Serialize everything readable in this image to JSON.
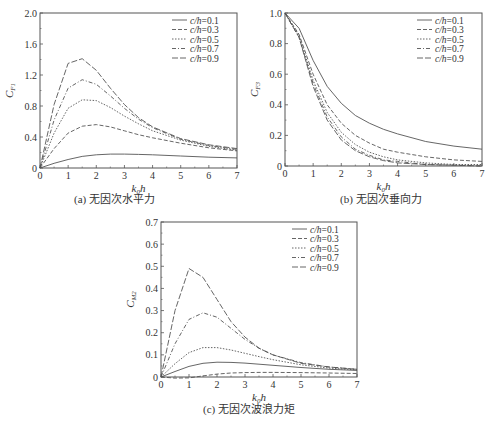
{
  "figure": {
    "captions": [
      "(a) 无因次水平力",
      "(b) 无因次垂向力",
      "(c) 无因次波浪力矩"
    ]
  },
  "chart_data": [
    {
      "type": "line",
      "title": "(a) 无因次水平力",
      "xlabel": "k0h",
      "ylabel": "C_F1",
      "xlim": [
        0,
        7
      ],
      "ylim": [
        0,
        2.0
      ],
      "xticks": [
        0,
        1,
        2,
        3,
        4,
        5,
        6,
        7
      ],
      "yticks": [
        0,
        0.4,
        0.8,
        1.2,
        1.6,
        2.0
      ],
      "ytick_labels": [
        "0",
        "0.4",
        "0.8",
        "1.2",
        "1.6",
        "2.0"
      ],
      "legend_position": "upper right",
      "x": [
        0,
        0.5,
        1,
        1.5,
        2,
        2.5,
        3,
        3.5,
        4,
        5,
        6,
        7
      ],
      "series": [
        {
          "name": "c/h=0.1",
          "style": "solid",
          "values": [
            0,
            0.06,
            0.11,
            0.15,
            0.17,
            0.18,
            0.18,
            0.175,
            0.17,
            0.155,
            0.14,
            0.13
          ]
        },
        {
          "name": "c/h=0.3",
          "style": "dashed",
          "values": [
            0,
            0.25,
            0.45,
            0.54,
            0.56,
            0.53,
            0.48,
            0.43,
            0.39,
            0.32,
            0.26,
            0.22
          ]
        },
        {
          "name": "c/h=0.5",
          "style": "dotted",
          "values": [
            0,
            0.45,
            0.77,
            0.88,
            0.87,
            0.78,
            0.67,
            0.57,
            0.48,
            0.36,
            0.28,
            0.23
          ]
        },
        {
          "name": "c/h=0.7",
          "style": "dashdot",
          "values": [
            0,
            0.62,
            1.03,
            1.14,
            1.08,
            0.93,
            0.77,
            0.63,
            0.52,
            0.37,
            0.29,
            0.24
          ]
        },
        {
          "name": "c/h=0.9",
          "style": "longdash",
          "values": [
            0,
            0.82,
            1.35,
            1.41,
            1.26,
            1.03,
            0.82,
            0.65,
            0.53,
            0.38,
            0.3,
            0.25
          ]
        }
      ]
    },
    {
      "type": "line",
      "title": "(b) 无因次垂向力",
      "xlabel": "k0h",
      "ylabel": "C_F3",
      "xlim": [
        0,
        7
      ],
      "ylim": [
        0,
        1.0
      ],
      "xticks": [
        0,
        1,
        2,
        3,
        4,
        5,
        6,
        7
      ],
      "yticks": [
        0,
        0.2,
        0.4,
        0.6,
        0.8,
        1.0
      ],
      "ytick_labels": [
        "0",
        "0.2",
        "0.4",
        "0.6",
        "0.8",
        "1.0"
      ],
      "legend_position": "upper right",
      "x": [
        0,
        0.5,
        1,
        1.5,
        2,
        2.5,
        3,
        3.5,
        4,
        5,
        6,
        7
      ],
      "series": [
        {
          "name": "c/h=0.1",
          "style": "solid",
          "values": [
            1.0,
            0.9,
            0.69,
            0.52,
            0.41,
            0.33,
            0.28,
            0.24,
            0.21,
            0.16,
            0.13,
            0.11
          ]
        },
        {
          "name": "c/h=0.3",
          "style": "dashed",
          "values": [
            1.0,
            0.86,
            0.6,
            0.4,
            0.28,
            0.2,
            0.15,
            0.11,
            0.09,
            0.06,
            0.04,
            0.03
          ]
        },
        {
          "name": "c/h=0.5",
          "style": "dotted",
          "values": [
            1.0,
            0.85,
            0.56,
            0.35,
            0.22,
            0.14,
            0.09,
            0.06,
            0.04,
            0.02,
            0.01,
            0.01
          ]
        },
        {
          "name": "c/h=0.7",
          "style": "dashdot",
          "values": [
            1.0,
            0.84,
            0.54,
            0.32,
            0.19,
            0.11,
            0.07,
            0.04,
            0.03,
            0.01,
            0.005,
            0.0
          ]
        },
        {
          "name": "c/h=0.9",
          "style": "longdash",
          "values": [
            1.0,
            0.84,
            0.52,
            0.3,
            0.17,
            0.1,
            0.06,
            0.035,
            0.02,
            0.01,
            0.005,
            0.0
          ]
        }
      ]
    },
    {
      "type": "line",
      "title": "(c) 无因次波浪力矩",
      "xlabel": "k0h",
      "ylabel": "C_M2",
      "xlim": [
        0,
        7
      ],
      "ylim": [
        0,
        0.7
      ],
      "xticks": [
        0,
        1,
        2,
        3,
        4,
        5,
        6,
        7
      ],
      "yticks": [
        0,
        0.1,
        0.2,
        0.3,
        0.4,
        0.5,
        0.6,
        0.7
      ],
      "ytick_labels": [
        "0",
        "0.1",
        "0.2",
        "0.3",
        "0.4",
        "0.5",
        "0.6",
        "0.7"
      ],
      "legend_position": "upper right",
      "x": [
        0,
        0.5,
        1,
        1.5,
        2,
        2.5,
        3,
        3.5,
        4,
        5,
        6,
        7
      ],
      "series": [
        {
          "name": "c/h=0.1",
          "style": "solid",
          "values": [
            0,
            0.025,
            0.048,
            0.062,
            0.067,
            0.066,
            0.063,
            0.058,
            0.053,
            0.043,
            0.035,
            0.03
          ]
        },
        {
          "name": "c/h=0.3",
          "style": "dashed",
          "values": [
            0,
            -0.005,
            -0.004,
            0.005,
            0.013,
            0.018,
            0.02,
            0.021,
            0.021,
            0.02,
            0.018,
            0.016
          ]
        },
        {
          "name": "c/h=0.5",
          "style": "dotted",
          "values": [
            0,
            0.06,
            0.11,
            0.133,
            0.133,
            0.122,
            0.107,
            0.092,
            0.078,
            0.055,
            0.04,
            0.032
          ]
        },
        {
          "name": "c/h=0.7",
          "style": "dashdot",
          "values": [
            0,
            0.15,
            0.26,
            0.29,
            0.27,
            0.22,
            0.17,
            0.13,
            0.1,
            0.065,
            0.045,
            0.035
          ]
        },
        {
          "name": "c/h=0.9",
          "style": "longdash",
          "values": [
            0,
            0.3,
            0.49,
            0.45,
            0.35,
            0.25,
            0.18,
            0.13,
            0.1,
            0.062,
            0.045,
            0.035
          ]
        }
      ]
    }
  ]
}
